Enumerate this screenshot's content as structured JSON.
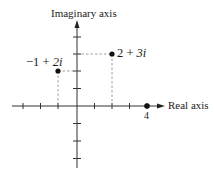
{
  "diagram": {
    "axes": {
      "imaginary_label": "Imaginary axis",
      "real_label": "Real axis",
      "real_tick_label": "4",
      "x_ticks": [
        -3,
        -2,
        -1,
        1,
        2,
        3,
        4
      ],
      "y_ticks": [
        -3,
        -2,
        -1,
        1,
        2,
        3,
        4
      ]
    },
    "points": [
      {
        "label_re": "2",
        "label_op": "+",
        "label_im": "3i",
        "re": 2,
        "im": 3
      },
      {
        "label_re": "−1",
        "label_op": "+",
        "label_im": "2i",
        "re": -1,
        "im": 2
      },
      {
        "label_re": "4",
        "re": 4,
        "im": 0
      }
    ]
  },
  "colors": {
    "ink": "#1a1a1a",
    "dash": "#888888",
    "axis": "#333333"
  }
}
